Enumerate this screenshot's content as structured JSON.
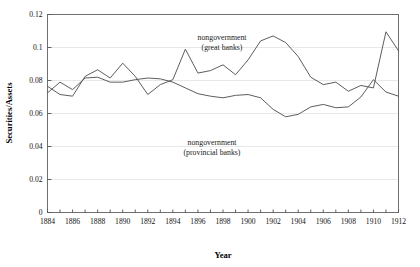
{
  "chart_data": {
    "type": "line",
    "title": "",
    "xlabel": "Year",
    "ylabel": "Securities/Assets",
    "xlim": [
      1884,
      1912
    ],
    "ylim": [
      0,
      0.12
    ],
    "grid": true,
    "legend_position": "inline-annotations",
    "x": [
      1884,
      1885,
      1886,
      1887,
      1888,
      1889,
      1890,
      1891,
      1892,
      1893,
      1894,
      1895,
      1896,
      1897,
      1898,
      1899,
      1900,
      1901,
      1902,
      1903,
      1904,
      1905,
      1906,
      1907,
      1908,
      1909,
      1910,
      1911,
      1912
    ],
    "xticks": [
      "1884",
      "1886",
      "1888",
      "1890",
      "1892",
      "1894",
      "1896",
      "1898",
      "1900",
      "1902",
      "1904",
      "1906",
      "1908",
      "1910",
      "1912"
    ],
    "yticks": [
      "0",
      "0.02",
      "0.04",
      "0.06",
      "0.08",
      "0.1",
      "0.12"
    ],
    "series": [
      {
        "name": "nongovernment (great banks)",
        "annotation_line1": "nongovernment",
        "annotation_line2": "(great banks)",
        "color": "#545454",
        "values": [
          0.0765,
          0.0715,
          0.0705,
          0.0825,
          0.0865,
          0.0815,
          0.0905,
          0.0825,
          0.0715,
          0.0775,
          0.0805,
          0.099,
          0.0845,
          0.086,
          0.0895,
          0.0835,
          0.0925,
          0.104,
          0.107,
          0.103,
          0.0945,
          0.082,
          0.0775,
          0.079,
          0.0735,
          0.077,
          0.0755,
          0.1095,
          0.098
        ]
      },
      {
        "name": "nongovernment (provincial banks)",
        "annotation_line1": "nongovernment",
        "annotation_line2": "(provincial banks)",
        "color": "#545454",
        "values": [
          0.0725,
          0.079,
          0.0745,
          0.0815,
          0.082,
          0.079,
          0.079,
          0.0805,
          0.0815,
          0.081,
          0.079,
          0.0755,
          0.072,
          0.0705,
          0.0695,
          0.071,
          0.0715,
          0.0695,
          0.0625,
          0.058,
          0.0595,
          0.064,
          0.0655,
          0.0635,
          0.064,
          0.07,
          0.0805,
          0.073,
          0.0705
        ]
      }
    ],
    "annotations": [
      {
        "text_line1": "nongovernment",
        "text_line2": "(great banks)",
        "x_px": 222,
        "y_px": 40
      },
      {
        "text_line1": "nongovernment",
        "text_line2": "(provincial banks)",
        "x_px": 212,
        "y_px": 145
      }
    ]
  }
}
